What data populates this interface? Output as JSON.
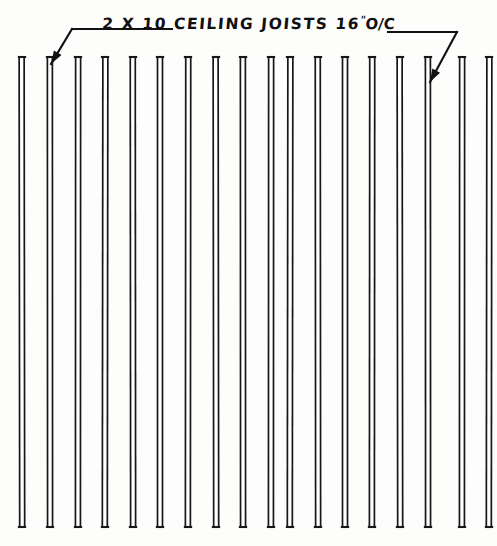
{
  "drawing": {
    "title": "2 X 10 CEILING JOISTS 16\" O/C",
    "annotation": {
      "member_size": "2 X 10",
      "member_type": "CEILING JOISTS",
      "spacing_value": "16",
      "spacing_unit": "\"",
      "spacing_note": "O/C",
      "full_text": "2 X 10 CEILING JOISTS 16\" O/C"
    },
    "ink_color": "#17171a",
    "paper_color": "#fdfdfc",
    "joists": {
      "count": 18,
      "top_y": 57,
      "bottom_y": 527,
      "member_width": 5,
      "center_spacing": 27.5,
      "x_positions": [
        22,
        50,
        78,
        105,
        133,
        160,
        188,
        216,
        243,
        271,
        290,
        318,
        345,
        372,
        400,
        428,
        462,
        489
      ]
    },
    "leaders": [
      {
        "name": "left-leader",
        "bend_x": 72,
        "bend_y": 29,
        "arrow_x": 51,
        "arrow_y": 64,
        "rail_end_x": 172
      },
      {
        "name": "right-leader",
        "bend_x": 457,
        "bend_y": 32,
        "arrow_x": 430,
        "arrow_y": 82,
        "rail_end_x": 388
      }
    ]
  }
}
